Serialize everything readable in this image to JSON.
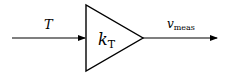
{
  "diagram": {
    "type": "block-diagram",
    "input": {
      "label": "T"
    },
    "gain_block": {
      "shape": "triangle",
      "label_base": "k",
      "label_sub": "T"
    },
    "output": {
      "label_base": "v",
      "label_sub": "meas"
    },
    "colors": {
      "stroke": "#000000",
      "background": "#ffffff"
    }
  }
}
